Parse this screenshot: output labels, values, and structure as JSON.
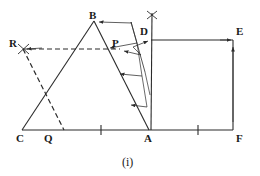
{
  "figure": {
    "caption": "(i)",
    "stroke_color": "#2b2b2b",
    "background_color": "#ffffff",
    "width": 260,
    "height": 176
  },
  "vertex_labels": [
    {
      "name": "R",
      "text": "R",
      "x": 9,
      "y": 38
    },
    {
      "name": "B",
      "text": "B",
      "x": 89,
      "y": 10
    },
    {
      "name": "P",
      "text": "P",
      "x": 112,
      "y": 38
    },
    {
      "name": "D",
      "text": "D",
      "x": 140,
      "y": 26
    },
    {
      "name": "E",
      "text": "E",
      "x": 236,
      "y": 26
    },
    {
      "name": "C",
      "text": "C",
      "x": 16,
      "y": 133
    },
    {
      "name": "Q",
      "text": "Q",
      "x": 44,
      "y": 133
    },
    {
      "name": "A",
      "text": "A",
      "x": 144,
      "y": 133
    },
    {
      "name": "F",
      "text": "F",
      "x": 236,
      "y": 133
    }
  ],
  "points": {
    "R": {
      "x": 23,
      "y": 49
    },
    "B": {
      "x": 94,
      "y": 21
    },
    "P": {
      "x": 120,
      "y": 49
    },
    "D": {
      "x": 151,
      "y": 40
    },
    "E": {
      "x": 233,
      "y": 40
    },
    "C": {
      "x": 22,
      "y": 130
    },
    "Q": {
      "x": 62,
      "y": 130
    },
    "A": {
      "x": 149,
      "y": 130
    },
    "F": {
      "x": 233,
      "y": 130
    },
    "cross_mark": {
      "x": 152,
      "y": 15
    }
  },
  "segments": [
    {
      "name": "base-line-C-F",
      "x1": 22,
      "y1": 130,
      "x2": 233,
      "y2": 130,
      "style": "solid"
    },
    {
      "name": "triangle-side-C-B",
      "x1": 22,
      "y1": 130,
      "x2": 94,
      "y2": 21,
      "style": "solid"
    },
    {
      "name": "triangle-side-B-A",
      "x1": 94,
      "y1": 21,
      "x2": 149,
      "y2": 130,
      "style": "solid"
    },
    {
      "name": "vertical-A-to-top",
      "x1": 151,
      "y1": 130,
      "x2": 152,
      "y2": 13,
      "style": "solid"
    },
    {
      "name": "rect-top-D-E",
      "x1": 151,
      "y1": 40,
      "x2": 233,
      "y2": 40,
      "style": "solid"
    },
    {
      "name": "rect-right-E-F",
      "x1": 233,
      "y1": 40,
      "x2": 233,
      "y2": 130,
      "style": "solid"
    },
    {
      "name": "shear-line-top",
      "x1": 131,
      "y1": 22,
      "x2": 145,
      "y2": 72,
      "style": "solid"
    },
    {
      "name": "dashed-R-to-P",
      "x1": 23,
      "y1": 49,
      "x2": 120,
      "y2": 49,
      "style": "dashed"
    },
    {
      "name": "dashed-R-to-Q",
      "x1": 23,
      "y1": 49,
      "x2": 64,
      "y2": 130,
      "style": "dashed"
    }
  ],
  "projection_arrows": [
    {
      "name": "arrow-to-B",
      "x1": 132,
      "y1": 23,
      "x2": 97,
      "y2": 22
    },
    {
      "name": "arrow-to-P",
      "x1": 141,
      "y1": 54,
      "x2": 123,
      "y2": 50
    },
    {
      "name": "arrow-to-D",
      "x1": 133,
      "y1": 47,
      "x2": 149,
      "y2": 41
    },
    {
      "name": "arrow-to-E",
      "x1": 222,
      "y1": 40,
      "x2": 232,
      "y2": 40
    },
    {
      "name": "arrow-ba-upper",
      "x1": 137,
      "y1": 42,
      "x2": 108,
      "y2": 47
    },
    {
      "name": "arrow-ba-mid",
      "x1": 141,
      "y1": 75,
      "x2": 118,
      "y2": 74
    },
    {
      "name": "arrow-ba-lower",
      "x1": 146,
      "y1": 106,
      "x2": 129,
      "y2": 104
    },
    {
      "name": "arrow-R-head",
      "x1": 40,
      "y1": 48,
      "x2": 25,
      "y2": 49
    },
    {
      "name": "arrow-F-up",
      "x1": 233,
      "y1": 120,
      "x2": 233,
      "y2": 45
    }
  ],
  "tick_marks": [
    {
      "name": "tick-base-left",
      "x": 101,
      "y": 130
    },
    {
      "name": "tick-base-right",
      "x": 198,
      "y": 130
    }
  ],
  "cross_marks": [
    {
      "name": "cross-top-vertical",
      "x": 152,
      "y": 15
    },
    {
      "name": "cross-at-R",
      "x": 23,
      "y": 49
    }
  ]
}
